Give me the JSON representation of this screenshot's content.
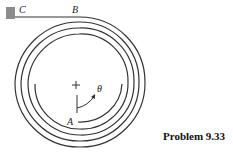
{
  "figure": {
    "caption": "Problem 9.33",
    "labels": {
      "C": "C",
      "B": "B",
      "A": "A",
      "theta": "θ"
    },
    "colors": {
      "line": "#333333",
      "wall": "#8c8c8c"
    },
    "coils": 4
  }
}
